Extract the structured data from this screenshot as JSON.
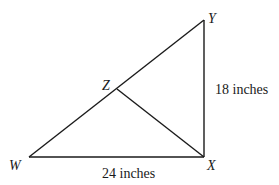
{
  "diagram": {
    "type": "right-triangle",
    "points": {
      "W": {
        "label": "W",
        "x": 29,
        "y": 157
      },
      "X": {
        "label": "X",
        "x": 204,
        "y": 157
      },
      "Y": {
        "label": "Y",
        "x": 204,
        "y": 20
      },
      "Z": {
        "label": "Z",
        "x": 117,
        "y": 89
      }
    },
    "segments": [
      "WX",
      "XY",
      "WY",
      "ZX"
    ],
    "measurements": {
      "WX": "24 inches",
      "XY": "18 inches"
    },
    "line_color": "#1a1a1a"
  }
}
